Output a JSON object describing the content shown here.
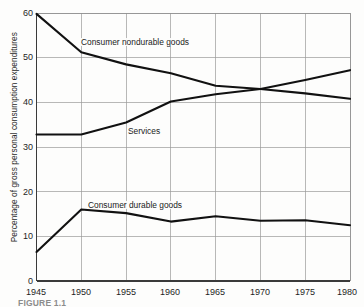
{
  "figure": {
    "caption": "FIGURE 1.1"
  },
  "chart_data": {
    "type": "line",
    "title": "",
    "subtitle": "",
    "xlabel": "",
    "ylabel": "Percentage of gross personal consumption expenditures",
    "x": [
      1945,
      1950,
      1955,
      1960,
      1965,
      1970,
      1975,
      1980
    ],
    "xlim": [
      1945,
      1980
    ],
    "ylim": [
      0,
      60
    ],
    "x_ticks": [
      "1945",
      "1950",
      "1955",
      "1960",
      "1965",
      "1970",
      "1975",
      "1980"
    ],
    "y_ticks": [
      "0",
      "10",
      "20",
      "30",
      "40",
      "50",
      "60"
    ],
    "grid": true,
    "legend_position": "inline-annotations",
    "series": [
      {
        "name": "Consumer nondurable goods",
        "color": "#111111",
        "values": [
          59.8,
          51.2,
          48.5,
          46.5,
          43.7,
          43.0,
          42.0,
          40.8
        ]
      },
      {
        "name": "Services",
        "color": "#111111",
        "values": [
          32.8,
          32.8,
          35.5,
          40.2,
          41.8,
          43.0,
          45.0,
          47.2
        ]
      },
      {
        "name": "Consumer durable goods",
        "color": "#111111",
        "values": [
          6.5,
          16.0,
          15.2,
          13.3,
          14.5,
          13.5,
          13.6,
          12.5
        ]
      }
    ],
    "annotations": [
      {
        "text": "Consumer nondurable goods",
        "x": 1950,
        "y": 53.5
      },
      {
        "text": "Services",
        "x": 1955,
        "y": 34.5
      },
      {
        "text": "Consumer durable goods",
        "x": 1951,
        "y": 18.0
      }
    ]
  }
}
